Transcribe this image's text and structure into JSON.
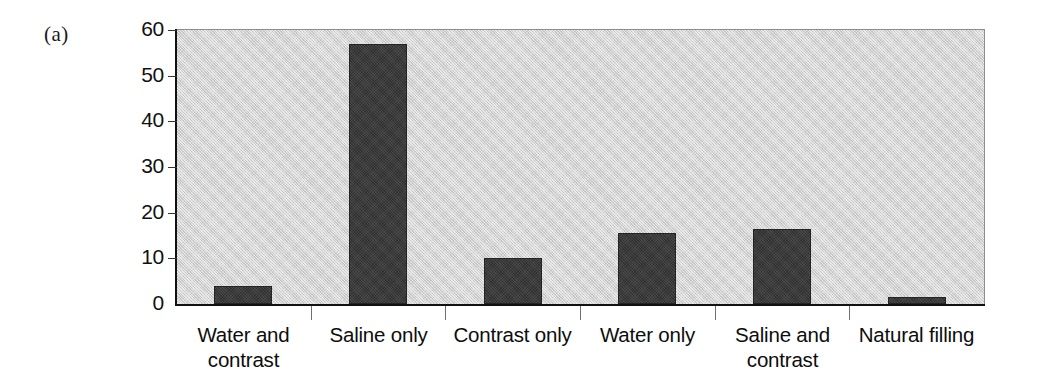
{
  "figure": {
    "panel_label": "(a)"
  },
  "chart_data": {
    "type": "bar",
    "title": "",
    "subtitle": "",
    "xlabel": "",
    "ylabel": "",
    "categories": [
      "Water and\ncontrast",
      "Saline only",
      "Contrast only",
      "Water only",
      "Saline and\ncontrast",
      "Natural filling"
    ],
    "values": [
      4,
      57,
      10,
      15.5,
      16.5,
      1.5
    ],
    "ylim": [
      0,
      60
    ],
    "yticks": [
      0,
      10,
      20,
      30,
      40,
      50,
      60
    ],
    "ytick_labels": [
      "0",
      "10",
      "20",
      "30",
      "40",
      "50",
      "60"
    ],
    "grid": false,
    "legend": null,
    "colors": {
      "bar_fill": "#3b3b3b",
      "bar_edge": "#242424",
      "plot_background": "#d3d3d3",
      "axis": "#111111",
      "text": "#0d0d0d"
    }
  }
}
